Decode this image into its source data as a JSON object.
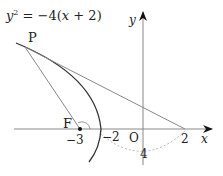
{
  "diagram": {
    "equation": "y² = −4(x + 2)",
    "labels": {
      "P": "P",
      "F": "F",
      "O": "O",
      "x_axis": "x",
      "y_axis": "y",
      "tick_neg3": "−3",
      "tick_neg2": "−2",
      "tick_2": "2",
      "arc_label": "4"
    },
    "focus": {
      "x": -3,
      "y": 0
    },
    "vertex": {
      "x": -2,
      "y": 0
    },
    "point_on_x": {
      "x": 2,
      "y": 0
    },
    "colors": {
      "curve": "#333333",
      "lines": "#888888",
      "axes": "#888888",
      "dashed_arc": "#aaaaaa"
    }
  }
}
